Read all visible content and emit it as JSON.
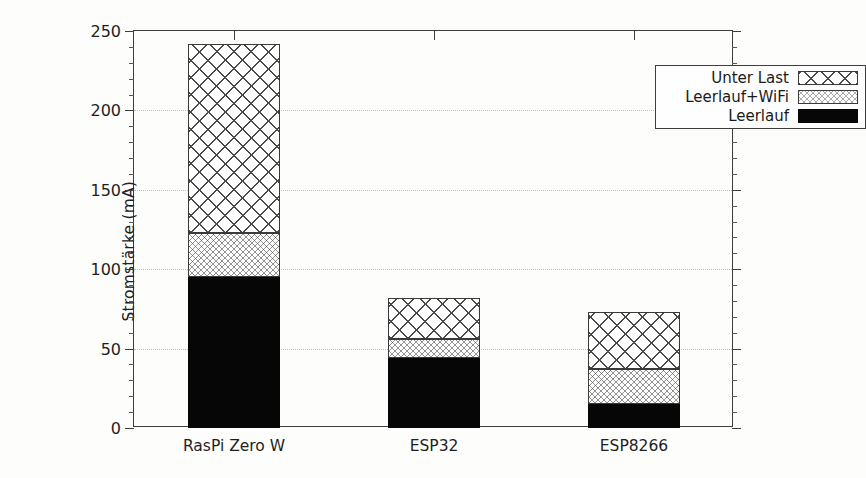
{
  "chart_data": {
    "type": "bar",
    "subtype": "stacked-bar",
    "title": "",
    "xlabel": "",
    "ylabel": "Stromstärke (mA)",
    "ylim": [
      0,
      250
    ],
    "ytick_values": [
      0,
      50,
      100,
      150,
      200,
      250
    ],
    "ytick_labels": [
      "0",
      "50",
      "100",
      "150",
      "200",
      "250"
    ],
    "y_minor_tick_step": 10,
    "grid": "horizontal-dotted",
    "legend_position": "upper right",
    "categories": [
      "RasPi Zero W",
      "ESP32",
      "ESP8266"
    ],
    "series": [
      {
        "name": "Leerlauf",
        "fill": "solid-black",
        "values": [
          95,
          44,
          15
        ]
      },
      {
        "name": "Leerlauf+WiFi",
        "fill": "fine-crosshatch",
        "values": [
          28,
          12,
          22
        ]
      },
      {
        "name": "Unter Last",
        "fill": "coarse-crosshatch",
        "values": [
          119,
          26,
          36
        ]
      }
    ],
    "cumulative_tops": {
      "RasPi Zero W": [
        95,
        123,
        242
      ],
      "ESP32": [
        44,
        56,
        82
      ],
      "ESP8266": [
        15,
        37,
        73
      ]
    },
    "colors": {
      "solid": "#060606",
      "hatch_line": "#4a4a4a",
      "axis": "#3d3d3d",
      "grid": "#bdbdbd",
      "background": "#fdfdfb"
    }
  },
  "axis": {
    "y_label": "Stromstärke (mA)",
    "y_ticks": [
      "0",
      "50",
      "100",
      "150",
      "200",
      "250"
    ],
    "x_labels": [
      "RasPi Zero W",
      "ESP32",
      "ESP8266"
    ]
  },
  "legend": {
    "entries": [
      {
        "label": "Unter Last",
        "pattern": "coarse-crosshatch"
      },
      {
        "label": "Leerlauf+WiFi",
        "pattern": "fine-crosshatch"
      },
      {
        "label": "Leerlauf",
        "pattern": "solid-black"
      }
    ]
  }
}
